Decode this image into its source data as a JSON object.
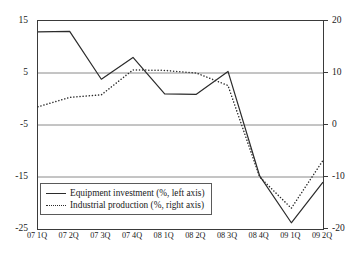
{
  "chart_data": {
    "type": "line",
    "title": "",
    "xlabel": "",
    "ylabel": "",
    "grid": true,
    "legend_position": "bottom-left",
    "categories": [
      "07 1Q",
      "07 2Q",
      "07 3Q",
      "07 4Q",
      "08 1Q",
      "08 2Q",
      "08 3Q",
      "08 4Q",
      "09 1Q",
      "09 2Q"
    ],
    "left_axis": {
      "label": "Equipment investment (%, left axis)",
      "ylim": [
        -25,
        15
      ],
      "ticks": [
        15,
        5,
        -5,
        -15,
        -25
      ],
      "tick_labels": [
        "15",
        "5",
        "-5",
        "-15",
        "-25"
      ]
    },
    "right_axis": {
      "label": "Industrial production (%, right axis)",
      "ylim": [
        -20,
        20
      ],
      "ticks": [
        20,
        10,
        0,
        -10,
        -20
      ],
      "tick_labels": [
        "20",
        "10",
        "0",
        "-10",
        "-20"
      ]
    },
    "series": [
      {
        "name": "Equipment investment (%, left axis)",
        "axis": "left",
        "style": "solid",
        "color": "#2b2b2b",
        "values": [
          12.9,
          13.0,
          3.8,
          8.0,
          1.0,
          0.9,
          5.3,
          -14.8,
          -23.8,
          -16.0
        ]
      },
      {
        "name": "Industrial production (%, right axis)",
        "axis": "right",
        "style": "dotted",
        "color": "#2b2b2b",
        "values": [
          3.5,
          5.3,
          5.8,
          10.6,
          10.5,
          10.0,
          7.6,
          -10.0,
          -16.0,
          -6.8
        ]
      }
    ]
  },
  "legend": {
    "items": [
      {
        "label": "Equipment investment (%, left axis)",
        "style": "solid",
        "icon": "solid-line-icon"
      },
      {
        "label": "Industrial production (%, right axis)",
        "style": "dotted",
        "icon": "dotted-line-icon"
      }
    ]
  },
  "colors": {
    "series_line": "#2b2b2b",
    "gridline": "#8a8a8a",
    "frame": "#3a3a3a",
    "background": "#ffffff",
    "text": "#1a1a1a"
  }
}
